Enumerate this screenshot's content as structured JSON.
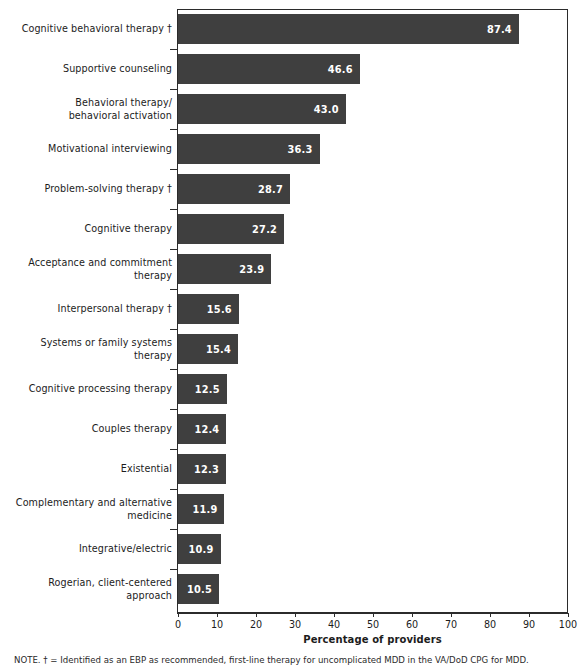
{
  "chart_data": {
    "type": "bar",
    "orientation": "horizontal",
    "title": "",
    "xlabel": "Percentage of providers",
    "ylabel": "",
    "xlim": [
      0,
      100
    ],
    "xticks": [
      0,
      10,
      20,
      30,
      40,
      50,
      60,
      70,
      80,
      90,
      100
    ],
    "grid": false,
    "legend": null,
    "bar_color": "#3f3f3f",
    "value_label_color": "#ffffff",
    "categories": [
      "Cognitive behavioral therapy †",
      "Supportive counseling",
      "Behavioral therapy/\nbehavioral activation",
      "Motivational interviewing",
      "Problem-solving therapy †",
      "Cognitive therapy",
      "Acceptance and commitment\ntherapy",
      "Interpersonal therapy †",
      "Systems or family systems\ntherapy",
      "Cognitive processing therapy",
      "Couples therapy",
      "Existential",
      "Complementary and alternative\nmedicine",
      "Integrative/electric",
      "Rogerian, client-centered\napproach"
    ],
    "values": [
      87.4,
      46.6,
      43.0,
      36.3,
      28.7,
      27.2,
      23.9,
      15.6,
      15.4,
      12.5,
      12.4,
      12.3,
      11.9,
      10.9,
      10.5
    ],
    "value_labels": [
      "87.4",
      "46.6",
      "43.0",
      "36.3",
      "28.7",
      "27.2",
      "23.9",
      "15.6",
      "15.4",
      "12.5",
      "12.4",
      "12.3",
      "11.9",
      "10.9",
      "10.5"
    ]
  },
  "footnote": {
    "text": "NOTE. † = Identified as an EBP as recommended, first-line therapy for uncomplicated MDD in the VA/DoD CPG for MDD."
  }
}
